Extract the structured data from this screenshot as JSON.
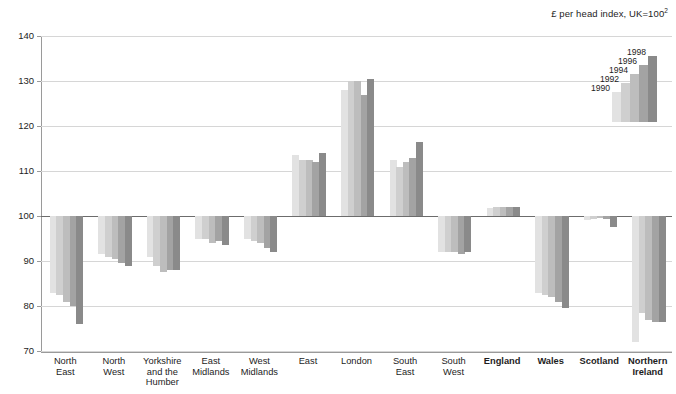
{
  "chart_data": {
    "type": "bar",
    "title": "£ per head index, UK=100",
    "title_superscript": "2",
    "xlabel": "",
    "ylabel": "",
    "ylim": [
      70,
      140
    ],
    "yticks": [
      70,
      80,
      90,
      100,
      110,
      120,
      130,
      140
    ],
    "grid": true,
    "baseline": 100,
    "legend_position": "top-right",
    "categories": [
      "North East",
      "North West",
      "Yorkshire and the Humber",
      "East Midlands",
      "West Midlands",
      "East",
      "London",
      "South East",
      "South West",
      "England",
      "Wales",
      "Scotland",
      "Northern Ireland"
    ],
    "category_lines": [
      [
        "North",
        "East"
      ],
      [
        "North",
        "West"
      ],
      [
        "Yorkshire",
        "and the",
        "Humber"
      ],
      [
        "East",
        "Midlands"
      ],
      [
        "West",
        "Midlands"
      ],
      [
        "East"
      ],
      [
        "London"
      ],
      [
        "South",
        "East"
      ],
      [
        "South",
        "West"
      ],
      [
        "England"
      ],
      [
        "Wales"
      ],
      [
        "Scotland"
      ],
      [
        "Northern",
        "Ireland"
      ]
    ],
    "category_bold": [
      false,
      false,
      false,
      false,
      false,
      false,
      false,
      false,
      false,
      true,
      true,
      true,
      true
    ],
    "series": [
      {
        "name": "1990",
        "color": "#e2e2e2",
        "values": [
          83.0,
          91.5,
          91.0,
          95.0,
          95.0,
          113.5,
          128.0,
          112.5,
          92.0,
          101.8,
          83.0,
          99.2,
          72.0
        ]
      },
      {
        "name": "1992",
        "color": "#cfcfcf",
        "values": [
          82.5,
          91.0,
          89.0,
          95.0,
          94.5,
          112.5,
          130.0,
          111.0,
          92.0,
          101.9,
          82.5,
          99.3,
          78.5
        ]
      },
      {
        "name": "1994",
        "color": "#bdbdbd",
        "values": [
          81.0,
          90.5,
          87.5,
          94.0,
          94.0,
          112.5,
          130.0,
          112.0,
          92.0,
          101.9,
          82.0,
          99.5,
          77.0
        ]
      },
      {
        "name": "1996",
        "color": "#a3a3a3",
        "values": [
          80.0,
          89.5,
          88.0,
          94.5,
          93.0,
          112.0,
          127.0,
          113.0,
          91.5,
          102.0,
          81.0,
          99.4,
          76.5
        ]
      },
      {
        "name": "1998",
        "color": "#8a8a8a",
        "values": [
          76.0,
          89.0,
          88.0,
          93.5,
          92.0,
          114.0,
          130.5,
          116.5,
          92.0,
          102.0,
          79.5,
          97.5,
          76.5
        ]
      }
    ]
  },
  "legend": {
    "entries": [
      "1990",
      "1992",
      "1994",
      "1996",
      "1998"
    ]
  }
}
